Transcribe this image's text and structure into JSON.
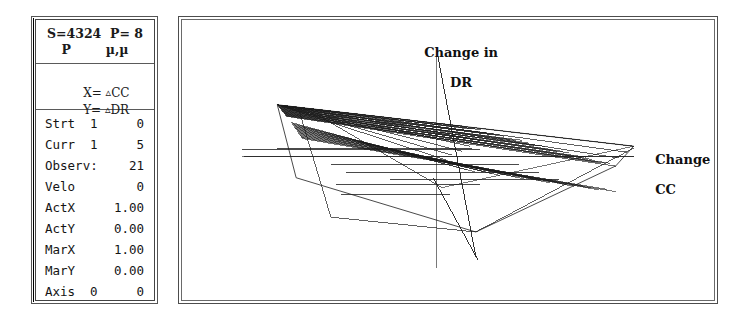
{
  "window": {
    "title": "Scatter Trajectory Display"
  },
  "status_panel": {
    "header": {
      "line1": "S=4324  P= 8",
      "line2": "P        µ,µ"
    },
    "axes": {
      "x_label": "X=",
      "x_value": "CC",
      "y_label": "Y=",
      "y_value": "DR",
      "delta_glyph": "▵"
    },
    "stats": [
      {
        "label": "Strt",
        "mid": "1",
        "value": "0"
      },
      {
        "label": "Curr",
        "mid": "1",
        "value": "5"
      },
      {
        "label": "Observ:",
        "mid": "",
        "value": "21"
      },
      {
        "label": "Velo",
        "mid": "",
        "value": "0"
      },
      {
        "label": "ActX",
        "mid": "",
        "value": "1.00"
      },
      {
        "label": "ActY",
        "mid": "",
        "value": "0.00"
      },
      {
        "label": "MarX",
        "mid": "",
        "value": "1.00"
      },
      {
        "label": "MarY",
        "mid": "",
        "value": "0.00"
      },
      {
        "label": "Axis",
        "mid": "0",
        "value": "0"
      }
    ]
  },
  "plot": {
    "y_axis_label_line1": "Change in",
    "y_axis_label_line2": "DR",
    "x_axis_label_line1": "Change in",
    "x_axis_label_line2": "CC",
    "line_color": "#1a1a1a",
    "axis_color": "#777777",
    "background": "#ffffff"
  },
  "chart_data": {
    "type": "line",
    "title": "",
    "xlabel": "Change in CC",
    "ylabel": "Change in DR",
    "grid": false,
    "legend": "none",
    "xlim": [
      0,
      536
    ],
    "ylim": [
      0,
      284
    ],
    "axes_lines": [
      {
        "name": "vertical-axis",
        "x1": 256,
        "y1": 38,
        "x2": 256,
        "y2": 252
      },
      {
        "name": "horizontal-axis",
        "x1": 60,
        "y1": 138,
        "x2": 455,
        "y2": 138
      }
    ],
    "steep_lines": [
      {
        "name": "steep-line-a",
        "x1": 258,
        "y1": 38,
        "x2": 296,
        "y2": 240
      },
      {
        "name": "steep-line-b",
        "x1": 253,
        "y1": 160,
        "x2": 298,
        "y2": 243
      }
    ],
    "fan_apex": {
      "x": 96,
      "y": 86
    },
    "right_focus": {
      "x": 437,
      "y": 148
    },
    "fan_targets": [
      {
        "x": 455,
        "y": 128
      },
      {
        "x": 448,
        "y": 134
      },
      {
        "x": 440,
        "y": 140
      },
      {
        "x": 300,
        "y": 122
      },
      {
        "x": 290,
        "y": 128
      },
      {
        "x": 282,
        "y": 133
      },
      {
        "x": 272,
        "y": 137
      },
      {
        "x": 266,
        "y": 142
      }
    ],
    "horizontal_segments": [
      {
        "x1": 60,
        "y": 131,
        "x2": 300
      },
      {
        "x1": 62,
        "y": 138,
        "x2": 455
      },
      {
        "x1": 96,
        "y": 130,
        "x2": 292
      },
      {
        "x1": 150,
        "y": 147,
        "x2": 340
      },
      {
        "x1": 165,
        "y": 155,
        "x2": 360
      },
      {
        "x1": 210,
        "y": 162,
        "x2": 380
      },
      {
        "x1": 155,
        "y": 167,
        "x2": 300
      },
      {
        "x1": 160,
        "y": 177,
        "x2": 270
      }
    ],
    "outline_polygon": [
      {
        "x": 96,
        "y": 86
      },
      {
        "x": 455,
        "y": 128
      },
      {
        "x": 437,
        "y": 148
      },
      {
        "x": 296,
        "y": 215
      },
      {
        "x": 115,
        "y": 160
      },
      {
        "x": 96,
        "y": 86
      }
    ]
  }
}
